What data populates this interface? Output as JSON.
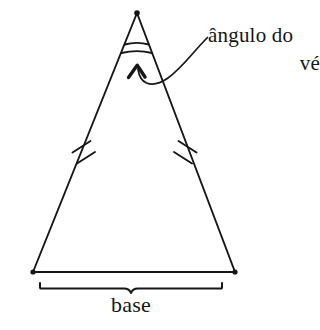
{
  "figure": {
    "stroke_color": "#161616",
    "background_color": "#ffffff"
  },
  "labels": {
    "base": "base",
    "vertex_angle_line1": "ângulo do",
    "vertex_angle_line2": "vé"
  },
  "geometry": {
    "apex": {
      "x": 137,
      "y": 13
    },
    "base_left": {
      "x": 33,
      "y": 272
    },
    "base_right": {
      "x": 235,
      "y": 272
    },
    "brace_left_x": 40,
    "brace_right_x": 222,
    "brace_y": 283,
    "brace_notch_x": 131,
    "angle_arc_1_y": 44,
    "angle_arc_2_y": 52,
    "tick_marks_per_side": 2,
    "left_tick_center": {
      "x": 84,
      "y": 148
    },
    "right_tick_center": {
      "x": 188,
      "y": 148
    },
    "arrow_tip": {
      "x": 137,
      "y": 66
    },
    "leader_start": {
      "x": 207,
      "y": 38
    }
  }
}
